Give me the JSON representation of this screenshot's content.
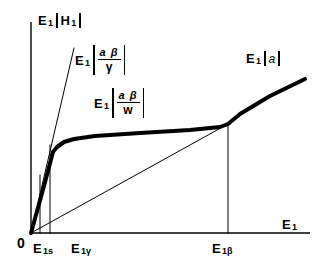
{
  "figure": {
    "background": "#ffffff",
    "line_color": "#000000"
  },
  "labels": {
    "y_axis": {
      "main": "E",
      "main_sub": "1",
      "arg": "H",
      "arg_sub": "1"
    },
    "x_axis": {
      "main": "E",
      "main_sub": "1"
    },
    "origin": "0",
    "tick_e1s": {
      "main": "E",
      "sub": "1s"
    },
    "tick_e1gamma": {
      "main": "E",
      "sub": "1γ"
    },
    "tick_e1beta": {
      "main": "E",
      "sub": "1β"
    },
    "slope_gamma": {
      "main": "E",
      "main_sub": "1",
      "numerator": "a β",
      "denominator": "γ"
    },
    "slope_w": {
      "main": "E",
      "main_sub": "1",
      "numerator": "a β",
      "denominator": "w"
    },
    "slope_a": {
      "main": "E",
      "main_sub": "1",
      "arg": "a"
    }
  },
  "chart_data": {
    "type": "line",
    "xlabel": "E1",
    "ylabel": "E1|H1|",
    "grid": false,
    "legend": "none",
    "axis": {
      "x_origin_px": 31,
      "y_origin_px": 233,
      "x_end_px": 310,
      "y_top_px": 22
    },
    "tick_labels_x": [
      "0",
      "E1s",
      "E1γ",
      "E1β"
    ],
    "tick_values_x_px": [
      31,
      40,
      50,
      228
    ],
    "series": [
      {
        "name": "E1|H1| response",
        "style": "thick",
        "width_px": 4,
        "points_px": [
          [
            31,
            233
          ],
          [
            44,
            186
          ],
          [
            53,
            152
          ],
          [
            57,
            147
          ],
          [
            64,
            142
          ],
          [
            74,
            139
          ],
          [
            95,
            136
          ],
          [
            140,
            133
          ],
          [
            190,
            130
          ],
          [
            220,
            127
          ],
          [
            228,
            124
          ],
          [
            240,
            114
          ],
          [
            270,
            96
          ],
          [
            305,
            79
          ]
        ],
        "description": "Steep initial rise with slope E1|aβ/γ|, knee near E1γ, shallow plateau region E1|aβ/w|, then break at E1β to final slope E1|a|"
      },
      {
        "name": "steep asymptote E1|aβ/γ|",
        "style": "thin",
        "width_px": 1,
        "points_px": [
          [
            31,
            233
          ],
          [
            74,
            48
          ]
        ]
      },
      {
        "name": "final asymptote E1|a| through origin",
        "style": "thin",
        "width_px": 1,
        "points_px": [
          [
            31,
            233
          ],
          [
            228,
            124
          ]
        ]
      },
      {
        "name": "drop line at E1s",
        "style": "thin",
        "width_px": 1,
        "points_px": [
          [
            40,
            233
          ],
          [
            40,
            175
          ]
        ]
      },
      {
        "name": "drop line at E1gamma",
        "style": "thin",
        "width_px": 1,
        "points_px": [
          [
            50,
            233
          ],
          [
            50,
            145
          ]
        ]
      },
      {
        "name": "drop line at E1beta",
        "style": "thin",
        "width_px": 1,
        "points_px": [
          [
            228,
            233
          ],
          [
            228,
            124
          ]
        ]
      }
    ]
  }
}
